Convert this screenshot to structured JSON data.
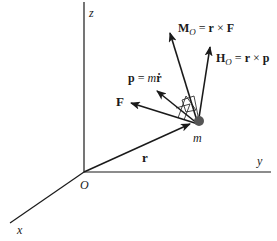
{
  "diagram": {
    "type": "3D vector diagram - angular momentum and moment of a particle",
    "axes": {
      "x_label": "x",
      "y_label": "y",
      "z_label": "z",
      "origin_label": "O"
    },
    "vectors": {
      "position": "r",
      "force": "F",
      "linear_momentum": "p = mṙ",
      "moment": "M_O = r × F",
      "angular_momentum": "H_O = r × p"
    },
    "particle_label": "m",
    "colors": {
      "line": "#1a1a1a",
      "particle": "#555555",
      "background": "#ffffff"
    }
  }
}
